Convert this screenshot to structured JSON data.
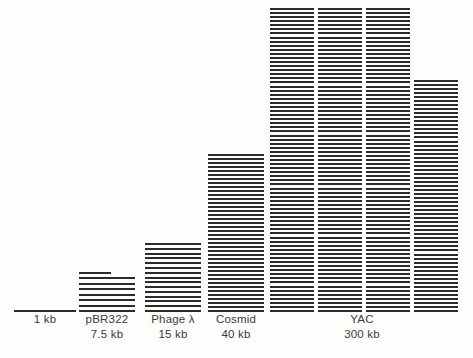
{
  "figure": {
    "background_color": "#fdfdfb",
    "line_color": "#2b2b2b",
    "text_color": "#3a3a3a"
  },
  "chart_data": {
    "type": "bar",
    "title": "",
    "subtitle": "",
    "xlabel": "",
    "ylabel": "",
    "unit": "kb",
    "unit_note": "each horizontal rule represents 1 kb of DNA",
    "grid": false,
    "legend": false,
    "ylim": [
      0,
      300
    ],
    "categories": [
      "1 kb",
      "pBR322",
      "Phage λ",
      "Cosmid",
      "YAC"
    ],
    "values": [
      1,
      7.5,
      15,
      40,
      300
    ],
    "tick_labels": [
      "1 kb",
      "7.5 kb",
      "15 kb",
      "40 kb",
      "300 kb"
    ],
    "series": [
      {
        "name": "Insert capacity",
        "values": [
          1,
          7.5,
          15,
          40,
          300
        ]
      }
    ],
    "annotations": [
      "YAC bar is drawn as four stacked columns of 75 kb each to fit the page",
      "pBR322 top rule is a half-length rule denoting the 0.5 kb remainder"
    ]
  },
  "bars": [
    {
      "id": "bar-1kb",
      "name": "1 kb",
      "size_label": "1 kb",
      "value_kb": 1,
      "columns": 1,
      "lines_per_column": 1,
      "has_half_line": false,
      "label_name": "1 kb",
      "label_size": ""
    },
    {
      "id": "bar-pbr322",
      "name": "pBR322",
      "size_label": "7.5 kb",
      "value_kb": 7.5,
      "columns": 1,
      "lines_per_column": 8,
      "has_half_line": true,
      "label_name": "pBR322",
      "label_size": "7.5 kb"
    },
    {
      "id": "bar-phage-lambda",
      "name": "Phage λ",
      "size_label": "15 kb",
      "value_kb": 15,
      "columns": 1,
      "lines_per_column": 15,
      "has_half_line": false,
      "label_name": "Phage λ",
      "label_size": "15 kb"
    },
    {
      "id": "bar-cosmid",
      "name": "Cosmid",
      "size_label": "40 kb",
      "value_kb": 40,
      "columns": 1,
      "lines_per_column": 40,
      "has_half_line": false,
      "label_name": "Cosmid",
      "label_size": "40 kb"
    },
    {
      "id": "bar-yac",
      "name": "YAC",
      "size_label": "300 kb",
      "value_kb": 300,
      "columns": 4,
      "lines_per_column": 75,
      "has_half_line": false,
      "label_name": "YAC",
      "label_size": "300 kb"
    }
  ],
  "labels": [
    {
      "name": "1 kb",
      "size": ""
    },
    {
      "name": "pBR322",
      "size": "7.5 kb"
    },
    {
      "name": "Phage λ",
      "size": "15 kb"
    },
    {
      "name": "Cosmid",
      "size": "40 kb"
    },
    {
      "name": "YAC",
      "size": "300 kb"
    }
  ]
}
